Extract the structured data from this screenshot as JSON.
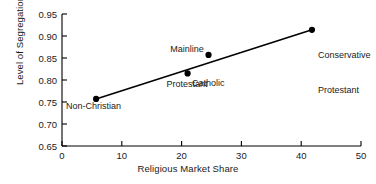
{
  "chart_data": {
    "type": "scatter",
    "title": "",
    "xlabel": "Religious Market Share",
    "ylabel": "Level of Segregation",
    "xlim": [
      0,
      50
    ],
    "ylim": [
      0.65,
      0.95
    ],
    "xticks": [
      "0",
      "10",
      "20",
      "30",
      "40",
      "50"
    ],
    "xtick_values": [
      0,
      10,
      20,
      30,
      40,
      50
    ],
    "yticks": [
      "0.65",
      "0.70",
      "0.75",
      "0.80",
      "0.85",
      "0.90",
      "0.95"
    ],
    "ytick_values": [
      0.65,
      0.7,
      0.75,
      0.8,
      0.85,
      0.9,
      0.95
    ],
    "grid": false,
    "legend": "none",
    "marker_color": "#000000",
    "line_color": "#000000",
    "axis_color": "#000000",
    "points": [
      {
        "name": "Non-Christian",
        "label": "Non-Christian",
        "x": 5.7,
        "y": 0.757
      },
      {
        "name": "Catholic",
        "label": "Catholic",
        "x": 21.0,
        "y": 0.815
      },
      {
        "name": "Mainline Protestant",
        "label": "Mainline\nProtestant",
        "x": 24.5,
        "y": 0.857
      },
      {
        "name": "Conservative Protestant",
        "label": "Conservative\nProtestant",
        "x": 41.8,
        "y": 0.914
      }
    ],
    "trendline": {
      "name": "fit-line",
      "x0": 5.7,
      "y0": 0.757,
      "x1": 41.8,
      "y1": 0.914
    }
  },
  "labels": {
    "non_christian": "Non-Christian",
    "catholic": "Catholic",
    "mainline_line1": "Mainline",
    "mainline_line2": "Protestant",
    "conservative_line1": "Conservative",
    "conservative_line2": "Protestant",
    "ylabel": "Level of Segregation",
    "xlabel": "Religious Market Share",
    "y0": "0.65",
    "y1": "0.70",
    "y2": "0.75",
    "y3": "0.80",
    "y4": "0.85",
    "y5": "0.90",
    "y6": "0.95",
    "x0": "0",
    "x1": "10",
    "x2": "20",
    "x3": "30",
    "x4": "40",
    "x5": "50"
  }
}
